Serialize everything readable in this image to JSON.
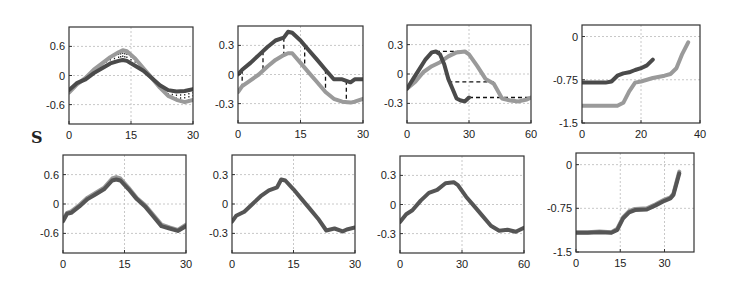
{
  "figure": {
    "side_label": "S"
  },
  "style": {
    "dark_series": "#4a4a4a",
    "light_series": "#9a9a9a",
    "axis": "#333333",
    "grid": "#c8c8c8"
  },
  "chart_data": [
    {
      "id": "top-1",
      "type": "line",
      "row": 0,
      "col": 0,
      "box": [
        69,
        27,
        193,
        124
      ],
      "xlim": [
        0,
        30
      ],
      "ylim": [
        -1.0,
        1.0
      ],
      "xticks": [
        0,
        15,
        30
      ],
      "yticks": [
        0.6,
        0,
        -0.6
      ],
      "xtick_labels": [
        "0",
        "15",
        "30"
      ],
      "ytick_labels": [
        "0.6",
        "0",
        "-0.6"
      ],
      "grid": true,
      "series": [
        {
          "name": "dark",
          "color": "#4a4a4a",
          "x": [
            0,
            2,
            4,
            6,
            8,
            10,
            12,
            13,
            14,
            16,
            18,
            20,
            22,
            24,
            26,
            28,
            30
          ],
          "y": [
            -0.3,
            -0.15,
            -0.08,
            0.05,
            0.15,
            0.25,
            0.3,
            0.32,
            0.3,
            0.2,
            0.1,
            -0.05,
            -0.2,
            -0.3,
            -0.33,
            -0.32,
            -0.28
          ]
        },
        {
          "name": "light",
          "color": "#9a9a9a",
          "x": [
            0,
            2,
            4,
            6,
            8,
            10,
            12,
            13,
            14,
            16,
            18,
            20,
            22,
            24,
            26,
            28,
            30
          ],
          "y": [
            -0.35,
            -0.18,
            -0.05,
            0.12,
            0.25,
            0.38,
            0.48,
            0.52,
            0.5,
            0.35,
            0.15,
            -0.05,
            -0.25,
            -0.42,
            -0.5,
            -0.55,
            -0.5
          ]
        }
      ],
      "connectors": "vertical-dotted"
    },
    {
      "id": "top-2",
      "type": "line",
      "row": 0,
      "col": 1,
      "box": [
        238,
        26,
        363,
        123
      ],
      "xlim": [
        0,
        30
      ],
      "ylim": [
        -0.5,
        0.5
      ],
      "xticks": [
        0,
        15,
        30
      ],
      "yticks": [
        0.3,
        0,
        -0.3
      ],
      "xtick_labels": [
        "0",
        "15",
        "30"
      ],
      "ytick_labels": [
        "0.3",
        "0",
        "-0.3"
      ],
      "grid": true,
      "series": [
        {
          "name": "dark",
          "color": "#4a4a4a",
          "x": [
            0,
            1,
            3,
            5,
            7,
            9,
            11,
            12,
            13,
            15,
            17,
            19,
            21,
            23,
            25,
            27,
            28,
            30
          ],
          "y": [
            0.0,
            0.05,
            0.12,
            0.2,
            0.28,
            0.35,
            0.38,
            0.44,
            0.43,
            0.35,
            0.25,
            0.15,
            0.05,
            -0.05,
            -0.05,
            -0.08,
            -0.05,
            -0.05
          ]
        },
        {
          "name": "light",
          "color": "#9a9a9a",
          "x": [
            0,
            1,
            3,
            5,
            7,
            9,
            11,
            12,
            13,
            15,
            17,
            19,
            21,
            23,
            25,
            27,
            28,
            30
          ],
          "y": [
            -0.18,
            -0.12,
            -0.06,
            0.0,
            0.08,
            0.15,
            0.2,
            0.22,
            0.22,
            0.12,
            0.02,
            -0.08,
            -0.18,
            -0.25,
            -0.28,
            -0.29,
            -0.28,
            -0.25
          ]
        }
      ],
      "connectors": "vertical-dashed",
      "connector_x": [
        1,
        6,
        11,
        16,
        21,
        26
      ]
    },
    {
      "id": "top-3",
      "type": "line",
      "row": 0,
      "col": 2,
      "box": [
        407,
        25,
        531,
        123
      ],
      "xlim": [
        0,
        60
      ],
      "ylim": [
        -0.5,
        0.5
      ],
      "xticks": [
        0,
        30,
        60
      ],
      "yticks": [
        0.3,
        0,
        -0.3
      ],
      "xtick_labels": [
        "0",
        "30",
        "60"
      ],
      "ytick_labels": [
        "0.3",
        "0",
        "-0.3"
      ],
      "grid": true,
      "series": [
        {
          "name": "dark",
          "color": "#4a4a4a",
          "x": [
            0,
            3,
            6,
            9,
            12,
            14,
            16,
            18,
            20,
            22,
            24,
            26,
            28,
            30
          ],
          "y": [
            -0.15,
            -0.05,
            0.05,
            0.15,
            0.22,
            0.23,
            0.2,
            0.1,
            -0.05,
            -0.15,
            -0.25,
            -0.27,
            -0.28,
            -0.24
          ]
        },
        {
          "name": "light",
          "color": "#9a9a9a",
          "x": [
            0,
            4,
            8,
            12,
            16,
            20,
            24,
            28,
            30,
            34,
            38,
            42,
            46,
            50,
            54,
            58,
            60
          ],
          "y": [
            -0.15,
            -0.08,
            0.02,
            0.08,
            0.12,
            0.18,
            0.22,
            0.23,
            0.2,
            0.08,
            -0.05,
            -0.1,
            -0.25,
            -0.27,
            -0.28,
            -0.26,
            -0.24
          ]
        }
      ],
      "connectors": "horizontal-dashed",
      "connector_segments": [
        [
          14,
          0.23,
          28,
          0.23
        ],
        [
          20,
          -0.08,
          42,
          -0.08
        ],
        [
          30,
          -0.24,
          60,
          -0.24
        ]
      ]
    },
    {
      "id": "top-4",
      "type": "line",
      "row": 0,
      "col": 3,
      "box": [
        582,
        25,
        700,
        123
      ],
      "xlim": [
        0,
        40
      ],
      "ylim": [
        -1.5,
        0.2
      ],
      "xticks": [
        0,
        20,
        40
      ],
      "yticks": [
        0,
        -0.75,
        -1.5
      ],
      "xtick_labels": [
        "0",
        "20",
        "40"
      ],
      "ytick_labels": [
        "0",
        "-0.75",
        "-1.5"
      ],
      "grid": true,
      "series": [
        {
          "name": "dark",
          "color": "#4a4a4a",
          "x": [
            0,
            4,
            8,
            10,
            12,
            14,
            16,
            18,
            20,
            22,
            24
          ],
          "y": [
            -0.8,
            -0.8,
            -0.8,
            -0.78,
            -0.68,
            -0.64,
            -0.62,
            -0.58,
            -0.55,
            -0.5,
            -0.4
          ]
        },
        {
          "name": "light",
          "color": "#9a9a9a",
          "x": [
            0,
            4,
            8,
            12,
            14,
            16,
            18,
            20,
            24,
            28,
            30,
            32,
            34,
            36
          ],
          "y": [
            -1.2,
            -1.2,
            -1.2,
            -1.2,
            -1.15,
            -0.95,
            -0.8,
            -0.78,
            -0.72,
            -0.68,
            -0.65,
            -0.55,
            -0.3,
            -0.1
          ]
        }
      ],
      "connectors": "none"
    },
    {
      "id": "bottom-1",
      "type": "line",
      "row": 1,
      "col": 0,
      "box": [
        63,
        155,
        186,
        253
      ],
      "xlim": [
        0,
        30
      ],
      "ylim": [
        -1.0,
        1.0
      ],
      "xticks": [
        0,
        15,
        30
      ],
      "yticks": [
        0.6,
        0,
        -0.6
      ],
      "xtick_labels": [
        "0",
        "15",
        "30"
      ],
      "ytick_labels": [
        "0.6",
        "0",
        "-0.6"
      ],
      "grid": true,
      "series": [
        {
          "name": "dark",
          "color": "#555555",
          "x": [
            0,
            1,
            2,
            4,
            6,
            8,
            10,
            12,
            13,
            14,
            16,
            18,
            20,
            22,
            24,
            26,
            28,
            30
          ],
          "y": [
            -0.35,
            -0.2,
            -0.18,
            -0.05,
            0.1,
            0.2,
            0.3,
            0.48,
            0.5,
            0.48,
            0.3,
            0.1,
            -0.05,
            -0.25,
            -0.45,
            -0.5,
            -0.55,
            -0.45
          ]
        },
        {
          "name": "light",
          "color": "#9a9a9a",
          "x": [
            0,
            1,
            2,
            4,
            6,
            8,
            10,
            12,
            13,
            14,
            16,
            18,
            20,
            22,
            24,
            26,
            28,
            30
          ],
          "y": [
            -0.32,
            -0.18,
            -0.15,
            -0.02,
            0.13,
            0.23,
            0.33,
            0.52,
            0.55,
            0.52,
            0.33,
            0.12,
            -0.02,
            -0.22,
            -0.42,
            -0.48,
            -0.53,
            -0.42
          ]
        }
      ],
      "connectors": "none"
    },
    {
      "id": "bottom-2",
      "type": "line",
      "row": 1,
      "col": 1,
      "box": [
        232,
        155,
        355,
        253
      ],
      "xlim": [
        0,
        30
      ],
      "ylim": [
        -0.5,
        0.5
      ],
      "xticks": [
        0,
        15,
        30
      ],
      "yticks": [
        0.3,
        0,
        -0.3
      ],
      "xtick_labels": [
        "0",
        "15",
        "30"
      ],
      "ytick_labels": [
        "0.3",
        "0",
        "-0.3"
      ],
      "grid": true,
      "series": [
        {
          "name": "aligned",
          "color": "#555555",
          "x": [
            0,
            1,
            3,
            5,
            7,
            9,
            11,
            12,
            13,
            15,
            17,
            19,
            21,
            23,
            25,
            27,
            28,
            30
          ],
          "y": [
            -0.18,
            -0.12,
            -0.08,
            0.0,
            0.08,
            0.14,
            0.17,
            0.25,
            0.24,
            0.15,
            0.05,
            -0.05,
            -0.15,
            -0.27,
            -0.25,
            -0.28,
            -0.26,
            -0.24
          ]
        }
      ],
      "connectors": "none"
    },
    {
      "id": "bottom-3",
      "type": "line",
      "row": 1,
      "col": 2,
      "box": [
        400,
        156,
        524,
        253
      ],
      "xlim": [
        0,
        60
      ],
      "ylim": [
        -0.5,
        0.5
      ],
      "xticks": [
        0,
        30,
        60
      ],
      "yticks": [
        0.3,
        0,
        -0.3
      ],
      "xtick_labels": [
        "0",
        "30",
        "60"
      ],
      "ytick_labels": [
        "0.3",
        "0",
        "-0.3"
      ],
      "grid": true,
      "series": [
        {
          "name": "aligned",
          "color": "#555555",
          "x": [
            0,
            3,
            6,
            10,
            14,
            18,
            22,
            26,
            28,
            32,
            36,
            40,
            44,
            48,
            52,
            56,
            60
          ],
          "y": [
            -0.18,
            -0.1,
            -0.06,
            0.04,
            0.12,
            0.15,
            0.22,
            0.23,
            0.2,
            0.08,
            -0.02,
            -0.12,
            -0.22,
            -0.27,
            -0.26,
            -0.28,
            -0.24
          ]
        }
      ],
      "connectors": "none"
    },
    {
      "id": "bottom-4",
      "type": "line",
      "row": 1,
      "col": 3,
      "box": [
        576,
        153,
        694,
        252
      ],
      "xlim": [
        0,
        40
      ],
      "ylim": [
        -1.5,
        0.2
      ],
      "xticks": [
        0,
        15,
        30
      ],
      "yticks": [
        0,
        -0.75,
        -1.5
      ],
      "xtick_labels": [
        "0",
        "15",
        "30"
      ],
      "ytick_labels": [
        "0",
        "-0.75",
        "-1.5"
      ],
      "grid": true,
      "series": [
        {
          "name": "dark",
          "color": "#555555",
          "x": [
            0,
            4,
            8,
            12,
            14,
            16,
            18,
            20,
            24,
            27,
            30,
            32,
            33,
            35
          ],
          "y": [
            -1.17,
            -1.17,
            -1.16,
            -1.17,
            -1.12,
            -0.92,
            -0.82,
            -0.78,
            -0.77,
            -0.7,
            -0.62,
            -0.58,
            -0.52,
            -0.15
          ]
        },
        {
          "name": "light",
          "color": "#9a9a9a",
          "x": [
            0,
            4,
            8,
            12,
            14,
            16,
            18,
            20,
            24,
            27,
            30,
            32,
            33,
            35
          ],
          "y": [
            -1.16,
            -1.16,
            -1.15,
            -1.16,
            -1.1,
            -0.9,
            -0.8,
            -0.76,
            -0.75,
            -0.68,
            -0.6,
            -0.56,
            -0.5,
            -0.12
          ]
        }
      ],
      "connectors": "none"
    }
  ]
}
